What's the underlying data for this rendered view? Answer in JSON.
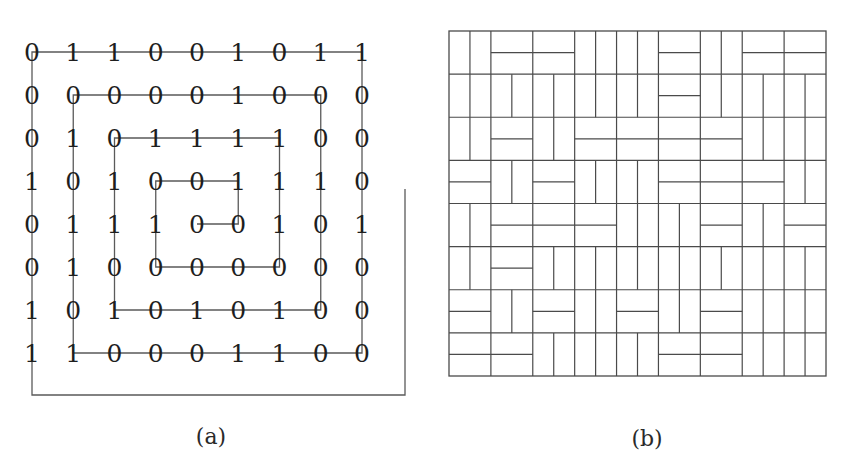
{
  "figure": {
    "panels": [
      {
        "id": "a",
        "caption": "(a)"
      },
      {
        "id": "b",
        "caption": "(b)"
      }
    ]
  },
  "chart_data": [
    {
      "type": "table",
      "panel": "a",
      "title": "(a)",
      "description": "9x8 binary matrix traversed by a spiral path",
      "rows": [
        [
          0,
          1,
          1,
          0,
          0,
          1,
          0,
          1,
          1
        ],
        [
          0,
          0,
          0,
          0,
          0,
          1,
          0,
          0,
          0
        ],
        [
          0,
          1,
          0,
          1,
          1,
          1,
          1,
          0,
          0
        ],
        [
          1,
          0,
          1,
          0,
          0,
          1,
          1,
          1,
          0
        ],
        [
          0,
          1,
          1,
          1,
          0,
          0,
          1,
          0,
          1
        ],
        [
          0,
          1,
          0,
          0,
          0,
          0,
          0,
          0,
          0
        ],
        [
          1,
          0,
          1,
          0,
          1,
          0,
          1,
          0,
          0
        ],
        [
          1,
          1,
          0,
          0,
          0,
          1,
          1,
          0,
          0
        ]
      ],
      "spiral_path_cells": [
        [
          0,
          0
        ],
        [
          0,
          8
        ],
        [
          7,
          8
        ],
        [
          7,
          1
        ],
        [
          1,
          1
        ],
        [
          1,
          7
        ],
        [
          6,
          7
        ],
        [
          6,
          2
        ],
        [
          2,
          2
        ],
        [
          2,
          6
        ],
        [
          5,
          6
        ],
        [
          5,
          3
        ],
        [
          3,
          3
        ],
        [
          3,
          5
        ],
        [
          4,
          5
        ],
        [
          4,
          4
        ]
      ],
      "spiral_tail": "path extends from cell (0,0) down past the last row, right past the last column, then up"
    },
    {
      "type": "diagram",
      "panel": "b",
      "title": "(b)",
      "description": "Domino tiling of an 18x16 grid built from 9x8 blocks of 2x2; block value 0 = two vertical dominoes, 1 = two horizontal dominoes (same matrix as (a))",
      "blocks_cols": 9,
      "blocks_rows": 8
    }
  ],
  "layout": {
    "a": {
      "col_x": [
        32,
        73.25,
        114.5,
        155.75,
        197,
        238.25,
        279.5,
        320.75,
        362
      ],
      "row_y": [
        52,
        95,
        138,
        181,
        224,
        267,
        310,
        353
      ],
      "tail_right_x": 405,
      "tail_top_y": 189,
      "tail_bottom_y": 395,
      "caption_x": 211,
      "caption_y": 444
    },
    "b": {
      "x0": 449,
      "y0": 31,
      "x1": 826,
      "y1": 376,
      "caption_x": 647,
      "caption_y": 446
    }
  }
}
